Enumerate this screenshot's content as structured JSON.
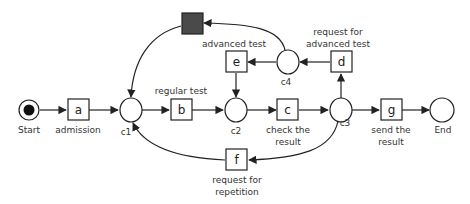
{
  "diagram": {
    "type": "petri-net",
    "places": {
      "start": {
        "id": "Start",
        "label": "Start",
        "marked": true
      },
      "c1": {
        "id": "c1",
        "label": "c1"
      },
      "c2": {
        "id": "c2",
        "label": "c2"
      },
      "c3": {
        "id": "c3",
        "label": "c3"
      },
      "c4": {
        "id": "c4",
        "label": "c4"
      },
      "end": {
        "id": "End",
        "label": "End"
      }
    },
    "transitions": {
      "a": {
        "id": "a",
        "caption": "admission"
      },
      "b": {
        "id": "b",
        "caption": "regular test"
      },
      "c": {
        "id": "c",
        "caption_line1": "check the",
        "caption_line2": "result"
      },
      "d": {
        "id": "d",
        "caption_line1": "request for",
        "caption_line2": "advanced test"
      },
      "e": {
        "id": "e",
        "caption": "advanced test"
      },
      "f": {
        "id": "f",
        "caption_line1": "request for",
        "caption_line2": "repetition"
      },
      "g": {
        "id": "g",
        "caption_line1": "send the",
        "caption_line2": "result"
      },
      "silent": {
        "id": "",
        "caption": "",
        "filled": true
      }
    },
    "arcs": [
      {
        "from": "Start",
        "to": "a"
      },
      {
        "from": "a",
        "to": "c1"
      },
      {
        "from": "c1",
        "to": "b"
      },
      {
        "from": "b",
        "to": "c2"
      },
      {
        "from": "c2",
        "to": "c"
      },
      {
        "from": "c",
        "to": "c3"
      },
      {
        "from": "c3",
        "to": "g"
      },
      {
        "from": "g",
        "to": "End"
      },
      {
        "from": "c3",
        "to": "d"
      },
      {
        "from": "d",
        "to": "c4"
      },
      {
        "from": "c4",
        "to": "e"
      },
      {
        "from": "e",
        "to": "c2"
      },
      {
        "from": "c4",
        "to": "silent"
      },
      {
        "from": "silent",
        "to": "c1"
      },
      {
        "from": "c3",
        "to": "f"
      },
      {
        "from": "f",
        "to": "c1"
      }
    ],
    "colors": {
      "stroke": "#222222",
      "silent_fill": "#4a4a4a",
      "token": "#111111"
    }
  }
}
